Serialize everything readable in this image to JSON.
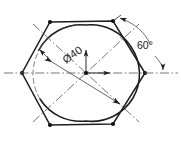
{
  "drawing": {
    "title": "Hexagon with inscribed circle — engineering drawing",
    "background_color": "#ffffff",
    "line_color": "#1d1d1d",
    "centerline_color": "#5a5a5a",
    "thin_line_color": "#6e6e6e",
    "dimensions": {
      "diameter": {
        "label": "Ø40",
        "value": 40,
        "symbol": "Ø",
        "rotation_deg": -36,
        "text_x": 66,
        "text_y": 64
      },
      "angle": {
        "label": "60°",
        "value": 60,
        "unit": "degrees",
        "text_x": 137,
        "text_y": 49
      }
    },
    "hexagon": {
      "name": "hexagon-outline",
      "vertex_count": 6,
      "vertices": [
        {
          "x": 50,
          "y": 22
        },
        {
          "x": 113,
          "y": 21
        },
        {
          "x": 145,
          "y": 73
        },
        {
          "x": 113,
          "y": 124
        },
        {
          "x": 50,
          "y": 125
        },
        {
          "x": 22,
          "y": 73
        }
      ],
      "vertex_markers": true
    },
    "circle": {
      "name": "inscribed-circle",
      "center_x": 86,
      "center_y": 73,
      "radius": 48
    },
    "center_point": {
      "x": 86,
      "y": 73
    },
    "centerlines": [
      {
        "name": "horizontal-centerline",
        "angle_deg": 0
      },
      {
        "name": "diagonal-centerline-a",
        "angle_deg": 58
      },
      {
        "name": "diagonal-centerline-b",
        "angle_deg": -58
      }
    ],
    "radius_arrows": [
      {
        "name": "radius-arrow-up",
        "direction": "up"
      },
      {
        "name": "radius-arrow-right",
        "direction": "right"
      }
    ]
  }
}
